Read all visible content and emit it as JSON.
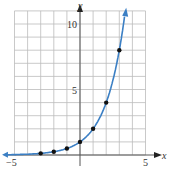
{
  "chart_data": {
    "type": "line",
    "title": "",
    "xlabel": "x",
    "ylabel": "y",
    "xlim": [
      -5,
      5
    ],
    "ylim": [
      0,
      10
    ],
    "grid": true,
    "x_tick_labels": [
      "-5",
      "5"
    ],
    "y_tick_labels": [
      "5",
      "10"
    ],
    "series": [
      {
        "name": "y = 2^x",
        "color": "#3b7fc4",
        "points": [
          [
            -3,
            0.125
          ],
          [
            -2,
            0.25
          ],
          [
            -1,
            0.5
          ],
          [
            0,
            1
          ],
          [
            1,
            2
          ],
          [
            2,
            4
          ],
          [
            3,
            8
          ]
        ]
      }
    ]
  },
  "labels": {
    "x_axis": "x",
    "y_axis": "y",
    "x_min": "−5",
    "x_max": "5",
    "y_mid": "5",
    "y_max": "10"
  }
}
